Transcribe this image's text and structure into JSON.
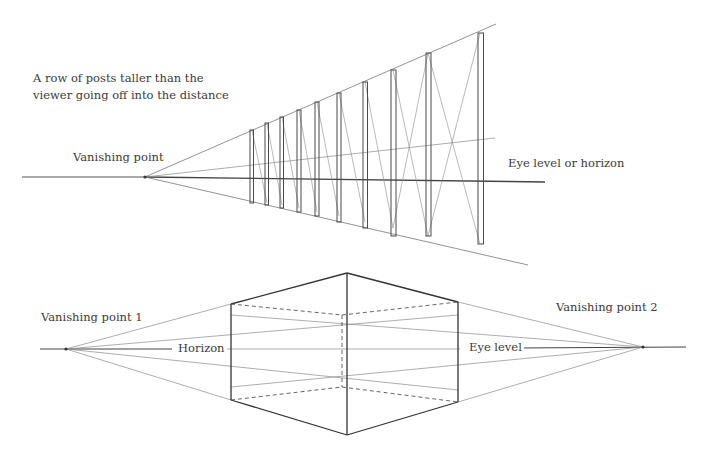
{
  "top_diagram": {
    "caption_line1": "A row of posts taller than the",
    "caption_line2": "viewer going off into the distance",
    "vanishing_point_label": "Vanishing point",
    "horizon_label": "Eye level or horizon",
    "post_count": 10
  },
  "bottom_diagram": {
    "vp1_label": "Vanishing point 1",
    "vp2_label": "Vanishing point 2",
    "horizon_label": "Horizon",
    "eye_level_label": "Eye level"
  },
  "colors": {
    "ink": "#3a3a3a",
    "faint": "#8a8a8a",
    "background": "#ffffff"
  }
}
